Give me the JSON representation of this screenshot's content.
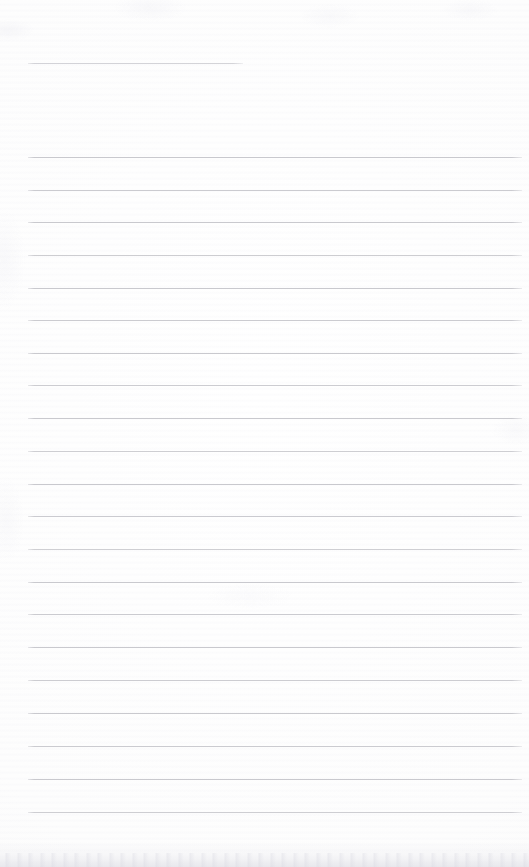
{
  "document": {
    "kind": "scanned-blank-lined-notepad-page",
    "page_text": "",
    "handwriting": "",
    "printed_text": "",
    "page_width_px": 529,
    "page_height_px": 867,
    "paper_color": "#fdfdfd",
    "rule_color": "#c9c9ce",
    "rule_thickness_px": 1,
    "rule_left_x_px": 28,
    "rule_right_x_px": 522,
    "rule_spacing_px": 32.75,
    "top_margin_px": 63,
    "bottom_blank_px": 55,
    "edge_shadow_color": "#e7e7ec"
  },
  "rules": [
    {
      "id": "rule-1",
      "y": 63,
      "x1": 28,
      "x2": 243,
      "kind": "short-header-rule",
      "opacity": 0.85
    },
    {
      "id": "rule-2",
      "y": 157,
      "x1": 28,
      "x2": 522,
      "kind": "full-rule",
      "opacity": 1.0
    },
    {
      "id": "rule-3",
      "y": 190,
      "x1": 28,
      "x2": 522,
      "kind": "full-rule",
      "opacity": 0.95
    },
    {
      "id": "rule-4",
      "y": 222,
      "x1": 28,
      "x2": 522,
      "kind": "full-rule",
      "opacity": 1.0
    },
    {
      "id": "rule-5",
      "y": 255,
      "x1": 28,
      "x2": 522,
      "kind": "full-rule",
      "opacity": 0.92
    },
    {
      "id": "rule-6",
      "y": 288,
      "x1": 28,
      "x2": 522,
      "kind": "full-rule",
      "opacity": 1.0
    },
    {
      "id": "rule-7",
      "y": 320,
      "x1": 28,
      "x2": 522,
      "kind": "full-rule",
      "opacity": 0.95
    },
    {
      "id": "rule-8",
      "y": 353,
      "x1": 28,
      "x2": 522,
      "kind": "full-rule",
      "opacity": 1.0
    },
    {
      "id": "rule-9",
      "y": 385,
      "x1": 28,
      "x2": 522,
      "kind": "full-rule",
      "opacity": 0.93
    },
    {
      "id": "rule-10",
      "y": 418,
      "x1": 28,
      "x2": 522,
      "kind": "full-rule",
      "opacity": 1.0
    },
    {
      "id": "rule-11",
      "y": 451,
      "x1": 28,
      "x2": 522,
      "kind": "full-rule",
      "opacity": 0.9
    },
    {
      "id": "rule-12",
      "y": 484,
      "x1": 28,
      "x2": 522,
      "kind": "full-rule",
      "opacity": 1.0
    },
    {
      "id": "rule-13",
      "y": 516,
      "x1": 28,
      "x2": 522,
      "kind": "full-rule",
      "opacity": 0.95
    },
    {
      "id": "rule-14",
      "y": 549,
      "x1": 28,
      "x2": 522,
      "kind": "full-rule",
      "opacity": 0.88
    },
    {
      "id": "rule-15",
      "y": 582,
      "x1": 28,
      "x2": 522,
      "kind": "full-rule",
      "opacity": 1.0
    },
    {
      "id": "rule-16",
      "y": 614,
      "x1": 28,
      "x2": 522,
      "kind": "full-rule",
      "opacity": 0.95
    },
    {
      "id": "rule-17",
      "y": 647,
      "x1": 28,
      "x2": 522,
      "kind": "full-rule",
      "opacity": 1.0
    },
    {
      "id": "rule-18",
      "y": 680,
      "x1": 28,
      "x2": 522,
      "kind": "full-rule",
      "opacity": 0.93
    },
    {
      "id": "rule-19",
      "y": 713,
      "x1": 28,
      "x2": 522,
      "kind": "full-rule",
      "opacity": 1.0
    },
    {
      "id": "rule-20",
      "y": 746,
      "x1": 28,
      "x2": 522,
      "kind": "full-rule",
      "opacity": 0.95
    },
    {
      "id": "rule-21",
      "y": 779,
      "x1": 28,
      "x2": 522,
      "kind": "full-rule",
      "opacity": 1.0
    },
    {
      "id": "rule-22",
      "y": 812,
      "x1": 28,
      "x2": 522,
      "kind": "full-rule",
      "opacity": 0.9
    }
  ]
}
